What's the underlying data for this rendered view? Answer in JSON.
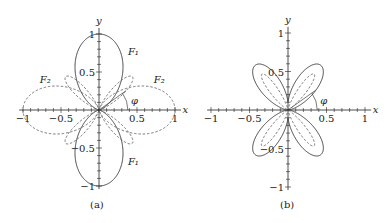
{
  "panels": [
    {
      "id": "a",
      "caption": "(a)",
      "origin": [
        99,
        110
      ],
      "scale": 76,
      "x_label": "x",
      "y_label": "y",
      "x_ticks": [
        {
          "v": -1,
          "t": "−1"
        },
        {
          "v": -0.5,
          "t": "−0.5"
        },
        {
          "v": 0.5,
          "t": "0.5"
        },
        {
          "v": 1,
          "t": "1"
        }
      ],
      "y_ticks": [
        {
          "v": 1,
          "t": "1"
        },
        {
          "v": 0.5,
          "t": "0.5"
        },
        {
          "v": -0.5,
          "t": "−0.5"
        },
        {
          "v": -1,
          "t": "−1"
        }
      ],
      "angle_label": "φ",
      "curve_labels": [
        {
          "t": "F₁",
          "x": 0.38,
          "y": 0.72
        },
        {
          "t": "F₁",
          "x": 0.38,
          "y": -0.72
        },
        {
          "t": "F₂",
          "x": -0.78,
          "y": 0.36
        },
        {
          "t": "F₂",
          "x": 0.72,
          "y": 0.36
        }
      ]
    },
    {
      "id": "b",
      "caption": "(b)",
      "origin": [
        288,
        110
      ],
      "scale": 77,
      "x_label": "x",
      "y_label": "y",
      "x_ticks": [
        {
          "v": -1,
          "t": "−1"
        },
        {
          "v": -0.5,
          "t": "−0.5"
        },
        {
          "v": 0.5,
          "t": "0.5"
        },
        {
          "v": 1,
          "t": "1"
        }
      ],
      "y_ticks": [
        {
          "v": 1,
          "t": "1"
        },
        {
          "v": 0.5,
          "t": "0.5"
        },
        {
          "v": -0.5,
          "t": "−0.5"
        },
        {
          "v": -1,
          "t": "−1"
        }
      ],
      "angle_label": "φ",
      "curve_labels": []
    }
  ]
}
